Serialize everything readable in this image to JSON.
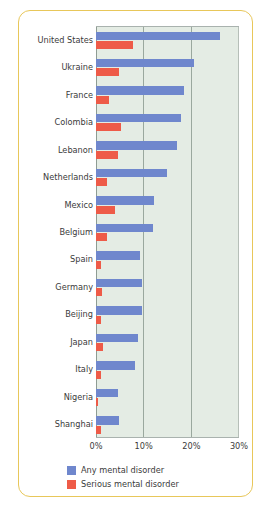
{
  "chart_data": {
    "type": "bar",
    "orientation": "horizontal",
    "title": "",
    "subtitle": "",
    "xlabel": "",
    "ylabel": "",
    "xlim": [
      0,
      30
    ],
    "xticks": [
      "0%",
      "10%",
      "20%",
      "30%"
    ],
    "xtick_values": [
      0,
      10,
      20,
      30
    ],
    "grid": true,
    "legend_position": "bottom",
    "categories": [
      "United States",
      "Ukraine",
      "France",
      "Colombia",
      "Lebanon",
      "Netherlands",
      "Mexico",
      "Belgium",
      "Spain",
      "Germany",
      "Beijing",
      "Japan",
      "Italy",
      "Nigeria",
      "Shanghai"
    ],
    "series": [
      {
        "name": "Any mental disorder",
        "color": "#6f87cd",
        "values": [
          26.0,
          20.5,
          18.4,
          17.8,
          16.9,
          14.9,
          12.2,
          12.0,
          9.2,
          9.6,
          9.6,
          8.8,
          8.2,
          4.7,
          4.9
        ]
      },
      {
        "name": "Serious mental disorder",
        "color": "#ee5b48",
        "values": [
          7.7,
          4.8,
          2.7,
          5.2,
          4.6,
          2.3,
          3.9,
          2.4,
          1.0,
          1.2,
          1.1,
          1.5,
          1.0,
          0.4,
          1.1
        ]
      }
    ]
  },
  "legend": {
    "items": [
      {
        "label": "Any mental disorder",
        "color": "#6f87cd"
      },
      {
        "label": "Serious mental disorder",
        "color": "#ee5b48"
      }
    ]
  },
  "colors": {
    "frame_border": "#e8c75a",
    "plot_background": "#e4ece4",
    "gridline": "#9aa89e",
    "label_text": "#3b3b3b",
    "any_mental_disorder": "#6f87cd",
    "serious_mental_disorder": "#ee5b48"
  }
}
